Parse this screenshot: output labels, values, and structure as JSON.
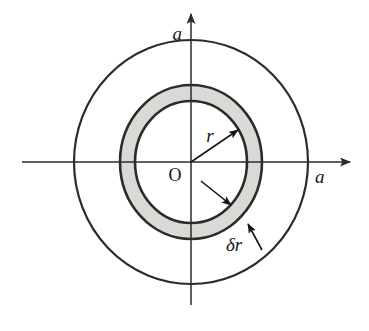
{
  "figure": {
    "background_color": "#ffffff",
    "width": 369,
    "height": 331
  },
  "chart_data": {
    "type": "diagram",
    "subtype": "geometric-annulus",
    "title": "",
    "xlabel": "",
    "ylabel": "",
    "center": {
      "label": "O",
      "x": 191,
      "y": 162
    },
    "axes": {
      "x_axis": {
        "from_x": 22,
        "to_x": 350,
        "y": 162,
        "arrow": "right",
        "label": "a"
      },
      "y_axis": {
        "x": 191,
        "from_y": 305,
        "to_y": 14,
        "arrow": "up",
        "label": "a"
      }
    },
    "circles": [
      {
        "name": "outer-disc",
        "role": "boundary radius a",
        "rx": 117,
        "ry": 122,
        "fill": "none",
        "stroke": "#2b2b2b",
        "stroke_width": 2.2
      },
      {
        "name": "annulus-outer",
        "role": "r plus delta r",
        "rx": 71,
        "ry": 77,
        "fill": "#d9d9d6",
        "stroke": "#2b2b2b",
        "stroke_width": 2.6
      },
      {
        "name": "annulus-inner",
        "role": "radius r",
        "rx": 56,
        "ry": 61,
        "fill": "#ffffff",
        "stroke": "#2b2b2b",
        "stroke_width": 2.6
      }
    ],
    "annotations": [
      {
        "name": "radius-arrow",
        "label": "r",
        "from": [
          191,
          162
        ],
        "to": [
          241,
          128
        ],
        "label_x": 209,
        "label_y": 138
      },
      {
        "name": "thickness-inner-arrow",
        "label": "",
        "from": [
          201,
          181
        ],
        "to": [
          234,
          207
        ]
      },
      {
        "name": "thickness-outer-arrow",
        "label": "δr",
        "from": [
          262,
          250
        ],
        "to": [
          246,
          221
        ],
        "label_x": 227,
        "label_y": 252
      }
    ],
    "colors": {
      "stroke": "#2b2b2b",
      "annulus_fill": "#d9d9d6",
      "background": "#ffffff",
      "text": "#16161a"
    }
  },
  "labels": {
    "origin": "O",
    "axis_top": "a",
    "axis_right": "a",
    "radius": "r",
    "thickness": "δr"
  }
}
